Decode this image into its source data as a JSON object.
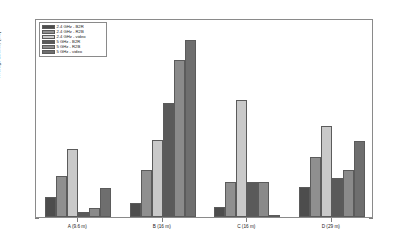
{
  "chart_data": {
    "type": "bar",
    "title": "",
    "subtitle": "",
    "xlabel": "",
    "ylabel": "Average Latency [ms]",
    "categories": [
      "A (9.6 m)",
      "B (16 m)",
      "C (16 m)",
      "D (29 m)"
    ],
    "ylim": [
      10,
      90
    ],
    "yticks": [
      10,
      20,
      30,
      40,
      50,
      60,
      70,
      80,
      90
    ],
    "ytick_labels": [
      "10",
      "20",
      "30",
      "40",
      "50",
      "60",
      "70",
      "80",
      "90"
    ],
    "grid": false,
    "legend_position": "upper left",
    "series": [
      {
        "name": "2.4 GHz - B2R",
        "color": "#4d4d4d",
        "values": [
          18.0,
          15.5,
          14.0,
          22.0
        ]
      },
      {
        "name": "2.4 GHz - R2B",
        "color": "#8f8f8f",
        "values": [
          26.5,
          29.0,
          24.0,
          34.0
        ]
      },
      {
        "name": "2.4 GHz - video",
        "color": "#c9c9c9",
        "values": [
          37.5,
          41.0,
          57.0,
          46.5
        ]
      },
      {
        "name": "5 GHz - B2R",
        "color": "#5a5a5a",
        "values": [
          12.0,
          56.0,
          24.0,
          25.5
        ]
      },
      {
        "name": "5 GHz - R2B",
        "color": "#8a8a8a",
        "values": [
          13.5,
          73.0,
          24.0,
          29.0
        ]
      },
      {
        "name": "5 GHz - video",
        "color": "#6e6e6e",
        "values": [
          21.5,
          81.0,
          10.5,
          40.5
        ]
      }
    ]
  },
  "figure": {
    "background_color": "#ffffff",
    "axes_border_color": "#8a8a8a",
    "text_color": "#1a1a1a"
  }
}
